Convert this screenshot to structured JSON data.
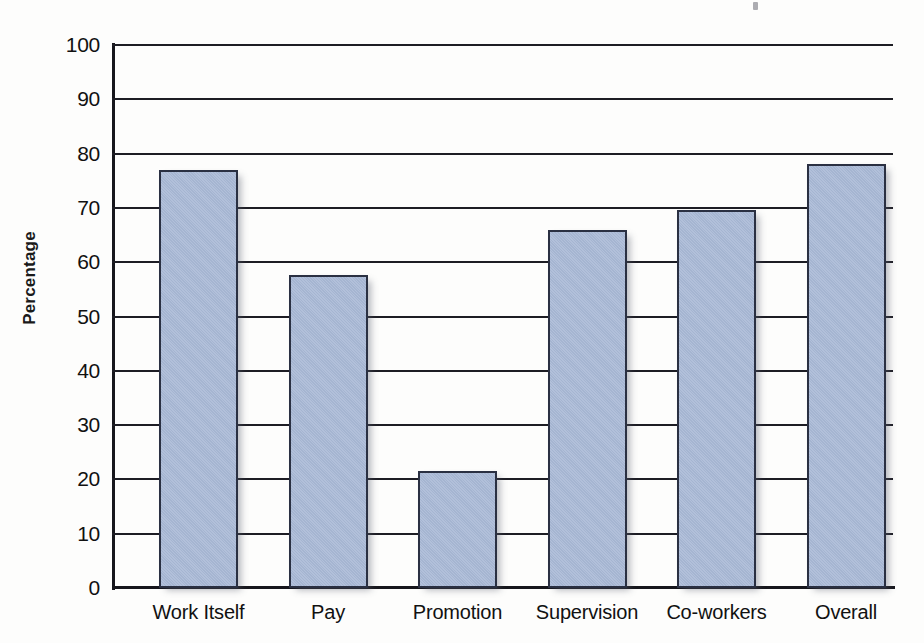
{
  "chart_data": {
    "type": "bar",
    "title": "",
    "subtitle": "",
    "xlabel": "",
    "ylabel": "Percentage",
    "ylim": [
      0,
      100
    ],
    "ytick_step": 10,
    "yticks": [
      100,
      90,
      80,
      70,
      60,
      50,
      40,
      30,
      20,
      10,
      0
    ],
    "ytick_labels": [
      "100",
      "90",
      "80",
      "70",
      "60",
      "50",
      "40",
      "30",
      "20",
      "10",
      "0"
    ],
    "categories": [
      "Work Itself",
      "Pay",
      "Promotion",
      "Supervision",
      "Co-workers",
      "Overall"
    ],
    "values": [
      77,
      57.7,
      21.5,
      66,
      69.7,
      78
    ],
    "grid": "horizontal",
    "legend": "none",
    "annotations": [],
    "series": [
      {
        "name": "Percentage",
        "values": [
          77,
          57.7,
          21.5,
          66,
          69.7,
          78
        ]
      }
    ]
  },
  "style": {
    "bar_fill": "#a9b9d6",
    "bar_border": "#2a3042",
    "gridline_color": "#1d1d24",
    "axis_color": "#16161c",
    "text_color": "#111111",
    "background": "#fdfdfc"
  },
  "bars": [
    {
      "label": "Work Itself",
      "value": 77
    },
    {
      "label": "Pay",
      "value": 57.7
    },
    {
      "label": "Promotion",
      "value": 21.5
    },
    {
      "label": "Supervision",
      "value": 66
    },
    {
      "label": "Co-workers",
      "value": 69.7
    },
    {
      "label": "Overall",
      "value": 78
    }
  ]
}
